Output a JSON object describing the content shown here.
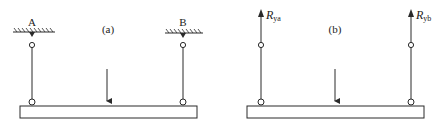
{
  "colors": {
    "ink": "#2a2a2a",
    "background": "#ffffff"
  },
  "panel_a": {
    "caption": "(a)",
    "support_left_label": "A",
    "support_right_label": "B",
    "description": "Beam hung from two pin-ended rods attached to fixed ceiling supports A and B, with a downward point load"
  },
  "panel_b": {
    "caption": "(b)",
    "reaction_left": {
      "symbol": "R",
      "subscript": "ya"
    },
    "reaction_right": {
      "symbol": "R",
      "subscript": "yb"
    },
    "description": "Free-body diagram: supports replaced by upward reaction forces R_ya and R_yb, with the same downward point load"
  }
}
